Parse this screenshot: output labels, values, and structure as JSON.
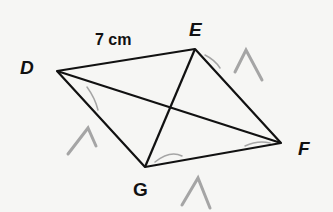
{
  "diagram": {
    "type": "quadrilateral with diagonals",
    "vertices": [
      {
        "name": "D",
        "x": 57,
        "y": 71
      },
      {
        "name": "E",
        "x": 195,
        "y": 49
      },
      {
        "name": "F",
        "x": 281,
        "y": 143
      },
      {
        "name": "G",
        "x": 145,
        "y": 167
      }
    ],
    "labels": {
      "D": "D",
      "E": "E",
      "F": "F",
      "G": "G"
    },
    "side_label": "7 cm",
    "line_color": "#111111",
    "annotation_color": "#9a9a9a"
  }
}
